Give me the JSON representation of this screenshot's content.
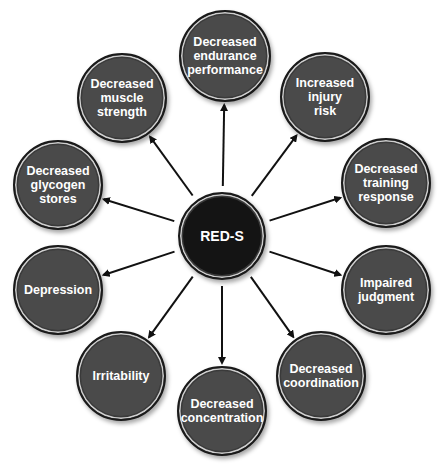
{
  "diagram": {
    "title": "RED-S",
    "center": {
      "label": "RED-S",
      "cx": 222,
      "cy": 236,
      "r": 44,
      "color": "#141414"
    },
    "outcome_color": "#4a4a4a",
    "arrow_color": "#111111",
    "outcomes": [
      {
        "label": "Decreased\nendurance\nperformance",
        "cx": 225,
        "cy": 56,
        "r": 46
      },
      {
        "label": "Increased\ninjury\nrisk",
        "cx": 325,
        "cy": 97,
        "r": 45
      },
      {
        "label": "Decreased\ntraining\nresponse",
        "cx": 386,
        "cy": 183,
        "r": 45
      },
      {
        "label": "Impaired\njudgment",
        "cx": 386,
        "cy": 290,
        "r": 45
      },
      {
        "label": "Decreased\ncoordination",
        "cx": 321,
        "cy": 376,
        "r": 45
      },
      {
        "label": "Decreased\nconcentration",
        "cx": 222,
        "cy": 411,
        "r": 45
      },
      {
        "label": "Irritability",
        "cx": 121,
        "cy": 376,
        "r": 45
      },
      {
        "label": "Depression",
        "cx": 58,
        "cy": 290,
        "r": 45
      },
      {
        "label": "Decreased\nglycogen\nstores",
        "cx": 58,
        "cy": 185,
        "r": 45
      },
      {
        "label": "Decreased\nmuscle\nstrength",
        "cx": 122,
        "cy": 98,
        "r": 45
      }
    ]
  }
}
